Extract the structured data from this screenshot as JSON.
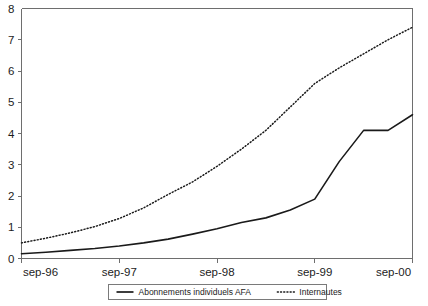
{
  "chart_data": {
    "type": "line",
    "title": "",
    "subtitle": "",
    "xlabel": "",
    "ylabel": "",
    "x": [
      "sep-96",
      "sep-97",
      "sep-98",
      "sep-99",
      "sep-00"
    ],
    "xtick_labels": [
      "sep-96",
      "sep-97",
      "sep-98",
      "sep-99",
      "sep-00"
    ],
    "ytick_labels": [
      "0",
      "1",
      "2",
      "3",
      "4",
      "5",
      "6",
      "7",
      "8"
    ],
    "ylim": [
      0,
      8
    ],
    "xlim": [
      0,
      4
    ],
    "grid": false,
    "legend_position": "bottom-center",
    "series": [
      {
        "name": "Abonnements individuels AFA",
        "style": "solid",
        "color": "#1a1a1a",
        "x": [
          0,
          0.25,
          0.5,
          0.75,
          1.0,
          1.25,
          1.5,
          1.75,
          2.0,
          2.25,
          2.5,
          2.75,
          3.0,
          3.25,
          3.5,
          3.75,
          4.0
        ],
        "values": [
          0.15,
          0.2,
          0.26,
          0.32,
          0.4,
          0.5,
          0.62,
          0.78,
          0.95,
          1.15,
          1.3,
          1.55,
          1.9,
          3.1,
          4.1,
          4.1,
          4.6
        ]
      },
      {
        "name": "Internautes",
        "style": "dotted",
        "color": "#1a1a1a",
        "x": [
          0,
          0.25,
          0.5,
          0.75,
          1.0,
          1.25,
          1.5,
          1.75,
          2.0,
          2.25,
          2.5,
          2.75,
          3.0,
          3.25,
          3.5,
          3.75,
          4.0
        ],
        "values": [
          0.5,
          0.65,
          0.82,
          1.02,
          1.28,
          1.62,
          2.05,
          2.45,
          2.95,
          3.5,
          4.1,
          4.85,
          5.6,
          6.1,
          6.55,
          7.0,
          7.4
        ]
      }
    ],
    "legend": [
      {
        "label": "Abonnements individuels AFA",
        "style": "solid"
      },
      {
        "label": "Internautes",
        "style": "dotted"
      }
    ]
  }
}
